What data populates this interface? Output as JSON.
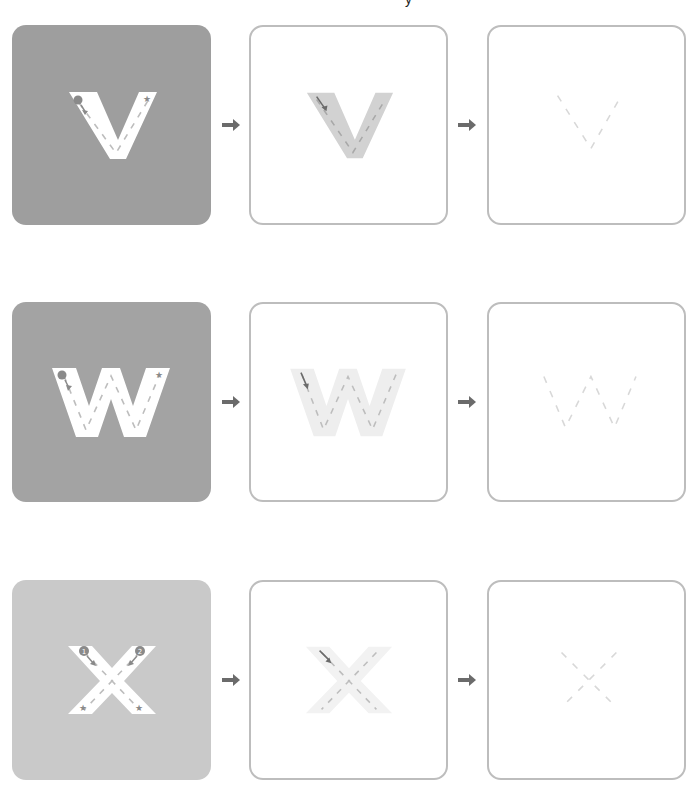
{
  "header": {
    "clipped_text": "y"
  },
  "colors": {
    "card_fill_dark": "#9e9e9e",
    "card_fill_mid": "#a3a3a3",
    "card_fill_light": "#c9c9c9",
    "outline": "#bdbdbd",
    "letter_white": "#ffffff",
    "trace_gray": "#d2d2d2",
    "trace_light": "#eeeeee",
    "dash": "#b5b5b5",
    "dash_faint": "#d8d8d8",
    "marker": "#8a8a8a",
    "arrow": "#6b6b6b"
  },
  "rows": [
    {
      "letter": "V",
      "steps": [
        {
          "label": "Guided trace with start dot and star end",
          "style": "filled"
        },
        {
          "label": "Shaded letter with dashed guide",
          "style": "outline"
        },
        {
          "label": "Dashed guide only",
          "style": "outline"
        }
      ]
    },
    {
      "letter": "W",
      "steps": [
        {
          "label": "Guided trace with start dot and star end",
          "style": "filled"
        },
        {
          "label": "Shaded letter with dashed guide",
          "style": "outline"
        },
        {
          "label": "Dashed guide only",
          "style": "outline"
        }
      ]
    },
    {
      "letter": "X",
      "steps": [
        {
          "label": "Guided trace with numbered starts 1 and 2 and star ends",
          "style": "filled"
        },
        {
          "label": "Shaded letter with dashed guide",
          "style": "outline"
        },
        {
          "label": "Dashed guide only",
          "style": "outline"
        }
      ],
      "stroke_numbers": [
        "1",
        "2"
      ]
    }
  ],
  "arrows": [
    "→",
    "→"
  ]
}
